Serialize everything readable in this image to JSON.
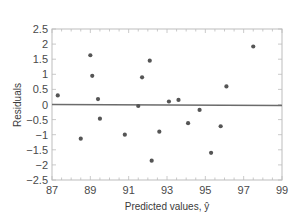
{
  "chart_data": {
    "type": "scatter",
    "title": "",
    "xlabel": "Predicted values, ŷ",
    "ylabel": "Residuals",
    "xlim": [
      87,
      99
    ],
    "ylim": [
      -2.5,
      2.5
    ],
    "x_ticks": [
      87,
      89,
      91,
      93,
      95,
      97,
      99
    ],
    "x_tick_labels": [
      "87",
      "89",
      "91",
      "93",
      "95",
      "97",
      "99"
    ],
    "y_ticks": [
      2.5,
      2,
      1.5,
      1,
      0.5,
      0,
      -0.5,
      -1,
      -1.5,
      -2,
      -2.5
    ],
    "y_tick_labels": [
      "2.5",
      "2",
      "1.5",
      "1",
      "0.5",
      "0",
      "−0.5",
      "−1",
      "−1.5",
      "−2",
      "−2.5"
    ],
    "grid": false,
    "legend": null,
    "reference_line": {
      "y": 0,
      "color": "#6b6b6b"
    },
    "series": [
      {
        "name": "Residuals",
        "color": "#555555",
        "points": [
          {
            "x": 87.3,
            "y": 0.3
          },
          {
            "x": 88.5,
            "y": -1.13
          },
          {
            "x": 89.0,
            "y": 1.63
          },
          {
            "x": 89.1,
            "y": 0.95
          },
          {
            "x": 89.4,
            "y": 0.18
          },
          {
            "x": 89.5,
            "y": -0.47
          },
          {
            "x": 90.8,
            "y": -1.0
          },
          {
            "x": 91.5,
            "y": -0.05
          },
          {
            "x": 91.7,
            "y": 0.9
          },
          {
            "x": 92.1,
            "y": 1.45
          },
          {
            "x": 92.2,
            "y": -1.86
          },
          {
            "x": 92.6,
            "y": -0.9
          },
          {
            "x": 93.1,
            "y": 0.1
          },
          {
            "x": 93.6,
            "y": 0.15
          },
          {
            "x": 94.1,
            "y": -0.62
          },
          {
            "x": 94.7,
            "y": -0.18
          },
          {
            "x": 95.3,
            "y": -1.6
          },
          {
            "x": 95.8,
            "y": -0.72
          },
          {
            "x": 96.1,
            "y": 0.6
          },
          {
            "x": 97.5,
            "y": 1.92
          }
        ]
      }
    ]
  },
  "colors": {
    "frame": "#bdbdbd",
    "zero_line": "#6b6b6b",
    "point": "#555555",
    "text": "#4a4a4a"
  }
}
